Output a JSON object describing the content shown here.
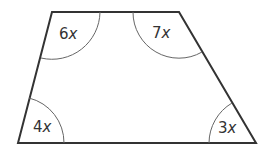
{
  "diagram": {
    "shape": "trapezoid",
    "vertices": {
      "top_left": [
        52,
        12
      ],
      "top_right": [
        179,
        12
      ],
      "bottom_right": [
        256,
        143
      ],
      "bottom_left": [
        18,
        143
      ]
    },
    "angles": [
      {
        "id": "top_left",
        "coef": "6",
        "var": "x"
      },
      {
        "id": "top_right",
        "coef": "7",
        "var": "x"
      },
      {
        "id": "bottom_left",
        "coef": "4",
        "var": "x"
      },
      {
        "id": "bottom_right",
        "coef": "3",
        "var": "x"
      }
    ],
    "colors": {
      "outline": "#333333",
      "arc": "#555555",
      "text": "#333333"
    }
  }
}
